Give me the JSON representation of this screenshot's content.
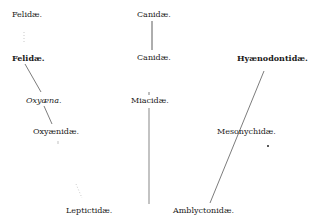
{
  "diagram": {
    "type": "phylogenetic-tree",
    "nodes": [
      {
        "id": "felidae_top",
        "label": "Felidæ.",
        "x": 12,
        "y": 10,
        "style": "regular"
      },
      {
        "id": "canidae_top",
        "label": "Canidæ.",
        "x": 144,
        "y": 10,
        "style": "regular"
      },
      {
        "id": "felidae",
        "label": "Felidæ.",
        "x": 12,
        "y": 53,
        "style": "bold"
      },
      {
        "id": "canidae",
        "label": "Canidæ.",
        "x": 144,
        "y": 53,
        "style": "regular"
      },
      {
        "id": "hyaenodontidae",
        "label": "Hyænodontidæ.",
        "x": 237,
        "y": 53,
        "style": "bold"
      },
      {
        "id": "oxyaena",
        "label": "Oxyæna.",
        "x": 26,
        "y": 96,
        "style": "italic"
      },
      {
        "id": "miacidae",
        "label": "Miacidæ.",
        "x": 144,
        "y": 96,
        "style": "regular"
      },
      {
        "id": "oxyaenidae",
        "label": "Oxyænidæ.",
        "x": 33,
        "y": 127,
        "style": "regular"
      },
      {
        "id": "mesonychidae",
        "label": "Mesonychidæ.",
        "x": 216,
        "y": 127,
        "style": "regular"
      },
      {
        "id": "leptictidae",
        "label": "Leptictidæ.",
        "x": 66,
        "y": 206,
        "style": "regular"
      },
      {
        "id": "amblyctonidae",
        "label": "Amblyctonidæ.",
        "x": 173,
        "y": 206,
        "style": "regular"
      }
    ],
    "edges": [
      {
        "from": "canidae_top",
        "to": "canidae"
      },
      {
        "from": "felidae",
        "to": "oxyaena"
      },
      {
        "from": "oxyaena",
        "to": "oxyaenidae"
      },
      {
        "from": "miacidae",
        "to": "amblyctonidae"
      },
      {
        "from": "hyaenodontidae",
        "to": "amblyctonidae"
      }
    ],
    "labels": {
      "felidae_top": "Felidæ.",
      "canidae_top": "Canidæ.",
      "felidae": "Felidæ.",
      "canidae": "Canidæ.",
      "hyaenodontidae": "Hyænodontidæ.",
      "oxyaena": "Oxyæna.",
      "miacidae": "Miacidæ.",
      "oxyaenidae": "Oxyænidæ.",
      "mesonychidae": "Mesonychidæ.",
      "leptictidae": "Leptictidæ.",
      "amblyctonidae": "Amblyctonidæ."
    }
  }
}
